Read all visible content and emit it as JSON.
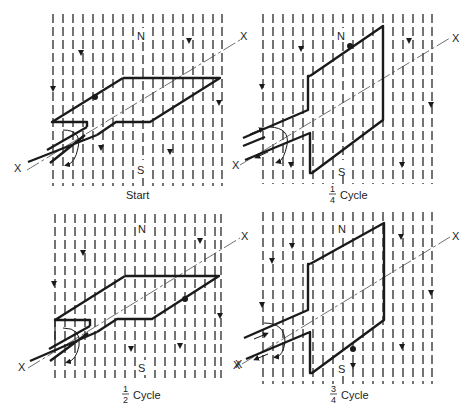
{
  "figure": {
    "colors": {
      "ink": "#1a1a1a",
      "background": "#ffffff"
    },
    "common_labels": {
      "north": "N",
      "south": "S",
      "axis": "X"
    },
    "panels": [
      {
        "id": "start",
        "caption": "Start",
        "caption_fraction": null,
        "orientation": "horizontal",
        "conductor_dot": "left-front edge"
      },
      {
        "id": "quarter",
        "caption": "Cycle",
        "caption_fraction": {
          "num": "1",
          "den": "4"
        },
        "orientation": "vertical",
        "conductor_dot": "top edge"
      },
      {
        "id": "half",
        "caption": "Cycle",
        "caption_fraction": {
          "num": "1",
          "den": "2"
        },
        "orientation": "horizontal",
        "conductor_dot": "right-back edge"
      },
      {
        "id": "three-quarter",
        "caption": "Cycle",
        "caption_fraction": {
          "num": "3",
          "den": "4"
        },
        "orientation": "vertical",
        "conductor_dot": "bottom edge"
      }
    ],
    "field": {
      "direction": "N to S (downward)",
      "line_count": 18,
      "icon": "arrow-down-icon"
    }
  }
}
